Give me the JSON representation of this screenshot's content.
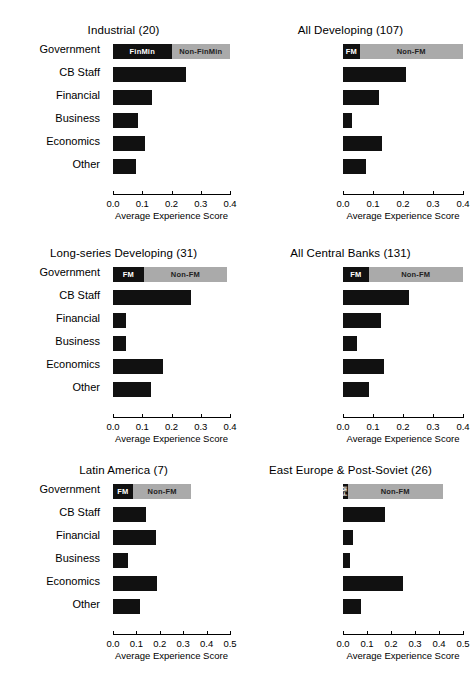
{
  "figure": {
    "categories": [
      "Government",
      "CB Staff",
      "Financial",
      "Business",
      "Economics",
      "Other"
    ],
    "xlabel": "Average Experience Score",
    "legend": {
      "fm_long": "FinMin",
      "nonfm_long": "Non-FinMin",
      "fm_short": "FM",
      "nonfm_short": "Non-FM"
    }
  },
  "chart_data": [
    {
      "type": "bar",
      "orientation": "horizontal",
      "title": "Industrial (20)",
      "xlabel": "Average Experience Score",
      "ylabel": "",
      "xlim": [
        0.0,
        0.4
      ],
      "xticks": [
        "0.0",
        "0.1",
        "0.2",
        "0.3",
        "0.4"
      ],
      "xtick_values": [
        0.0,
        0.1,
        0.2,
        0.3,
        0.4
      ],
      "grid": false,
      "categories": [
        "Government",
        "CB Staff",
        "Financial",
        "Business",
        "Economics",
        "Other"
      ],
      "stacked_first_row": true,
      "segment_labels": [
        "FinMin",
        "Non-FinMin"
      ],
      "values": [
        0.4,
        0.25,
        0.135,
        0.085,
        0.11,
        0.08
      ],
      "government_split": {
        "fm": 0.2,
        "non_fm": 0.2,
        "total": 0.4
      }
    },
    {
      "type": "bar",
      "orientation": "horizontal",
      "title": "All Developing (107)",
      "xlabel": "Average Experience Score",
      "ylabel": "",
      "xlim": [
        0.0,
        0.4
      ],
      "xticks": [
        "0.0",
        "0.1",
        "0.2",
        "0.3",
        "0.4"
      ],
      "xtick_values": [
        0.0,
        0.1,
        0.2,
        0.3,
        0.4
      ],
      "grid": false,
      "categories": [
        "Government",
        "CB Staff",
        "Financial",
        "Business",
        "Economics",
        "Other"
      ],
      "stacked_first_row": true,
      "segment_labels": [
        "FM",
        "Non-FM"
      ],
      "values": [
        0.4,
        0.21,
        0.12,
        0.03,
        0.13,
        0.075
      ],
      "government_split": {
        "fm": 0.055,
        "non_fm": 0.345,
        "total": 0.4
      }
    },
    {
      "type": "bar",
      "orientation": "horizontal",
      "title": "Long-series Developing (31)",
      "xlabel": "Average Experience Score",
      "ylabel": "",
      "xlim": [
        0.0,
        0.4
      ],
      "xticks": [
        "0.0",
        "0.1",
        "0.2",
        "0.3",
        "0.4"
      ],
      "xtick_values": [
        0.0,
        0.1,
        0.2,
        0.3,
        0.4
      ],
      "grid": false,
      "categories": [
        "Government",
        "CB Staff",
        "Financial",
        "Business",
        "Economics",
        "Other"
      ],
      "stacked_first_row": true,
      "segment_labels": [
        "FM",
        "Non-FM"
      ],
      "values": [
        0.39,
        0.265,
        0.045,
        0.045,
        0.17,
        0.13
      ],
      "government_split": {
        "fm": 0.105,
        "non_fm": 0.285,
        "total": 0.39
      }
    },
    {
      "type": "bar",
      "orientation": "horizontal",
      "title": "All Central Banks (131)",
      "xlabel": "Average Experience Score",
      "ylabel": "",
      "xlim": [
        0.0,
        0.4
      ],
      "xticks": [
        "0.0",
        "0.1",
        "0.2",
        "0.3",
        "0.4"
      ],
      "xtick_values": [
        0.0,
        0.1,
        0.2,
        0.3,
        0.4
      ],
      "grid": false,
      "categories": [
        "Government",
        "CB Staff",
        "Financial",
        "Business",
        "Economics",
        "Other"
      ],
      "stacked_first_row": true,
      "segment_labels": [
        "FM",
        "Non-FM"
      ],
      "values": [
        0.4,
        0.22,
        0.125,
        0.045,
        0.135,
        0.085
      ],
      "government_split": {
        "fm": 0.085,
        "non_fm": 0.315,
        "total": 0.4
      }
    },
    {
      "type": "bar",
      "orientation": "horizontal",
      "title": "Latin America (7)",
      "xlabel": "Average Experience Score",
      "ylabel": "",
      "xlim": [
        0.0,
        0.5
      ],
      "xticks": [
        "0.0",
        "0.1",
        "0.2",
        "0.3",
        "0.4",
        "0.5"
      ],
      "xtick_values": [
        0.0,
        0.1,
        0.2,
        0.3,
        0.4,
        0.5
      ],
      "grid": false,
      "categories": [
        "Government",
        "CB Staff",
        "Financial",
        "Business",
        "Economics",
        "Other"
      ],
      "stacked_first_row": true,
      "segment_labels": [
        "FM",
        "Non-FM"
      ],
      "values": [
        0.335,
        0.14,
        0.185,
        0.065,
        0.19,
        0.115
      ],
      "government_split": {
        "fm": 0.085,
        "non_fm": 0.25,
        "total": 0.335
      }
    },
    {
      "type": "bar",
      "orientation": "horizontal",
      "title": "East Europe & Post-Soviet (26)",
      "xlabel": "Average Experience Score",
      "ylabel": "",
      "xlim": [
        0.0,
        0.5
      ],
      "xticks": [
        "0.0",
        "0.1",
        "0.2",
        "0.3",
        "0.4",
        "0.5"
      ],
      "xtick_values": [
        0.0,
        0.1,
        0.2,
        0.3,
        0.4,
        0.5
      ],
      "grid": false,
      "categories": [
        "Government",
        "CB Staff",
        "Financial",
        "Business",
        "Economics",
        "Other"
      ],
      "stacked_first_row": true,
      "segment_labels": [
        "FM",
        "Non-FM"
      ],
      "values": [
        0.415,
        0.175,
        0.04,
        0.03,
        0.25,
        0.075
      ],
      "government_split": {
        "fm": 0.02,
        "non_fm": 0.395,
        "total": 0.415
      }
    }
  ],
  "colors": {
    "fm_bar": "#111111",
    "nonfm_bar": "#aaaaaa",
    "axis": "#000000",
    "background": "#ffffff"
  }
}
